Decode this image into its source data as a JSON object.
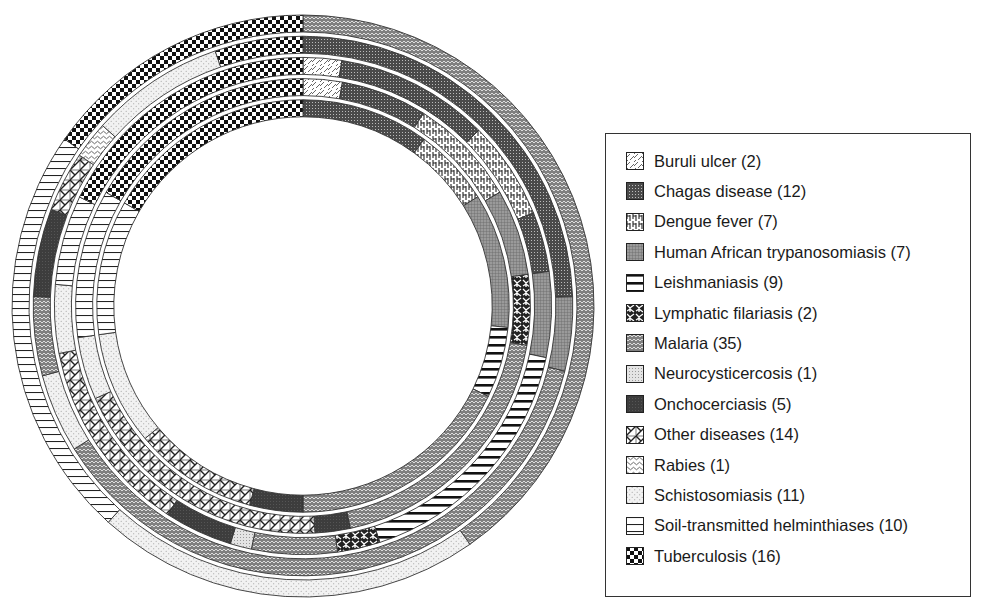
{
  "chart_data": {
    "type": "pie",
    "subtype": "concentric-rings",
    "title": "",
    "legend_position": "right",
    "categories": [
      {
        "key": "buruli",
        "label": "Buruli ulcer (2)",
        "count": 2
      },
      {
        "key": "chagas",
        "label": "Chagas disease (12)",
        "count": 12
      },
      {
        "key": "dengue",
        "label": "Dengue fever (7)",
        "count": 7
      },
      {
        "key": "hat",
        "label": "Human African trypanosomiasis (7)",
        "count": 7
      },
      {
        "key": "leish",
        "label": "Leishmaniasis (9)",
        "count": 9
      },
      {
        "key": "lymph",
        "label": "Lymphatic filariasis (2)",
        "count": 2
      },
      {
        "key": "malaria",
        "label": "Malaria (35)",
        "count": 35
      },
      {
        "key": "neuro",
        "label": "Neurocysticercosis (1)",
        "count": 1
      },
      {
        "key": "oncho",
        "label": "Onchocerciasis (5)",
        "count": 5
      },
      {
        "key": "other",
        "label": "Other diseases (14)",
        "count": 14
      },
      {
        "key": "rabies",
        "label": "Rabies (1)",
        "count": 1
      },
      {
        "key": "schisto",
        "label": "Schistosomiasis (11)",
        "count": 11
      },
      {
        "key": "soil",
        "label": "Soil-transmitted helminthiases (10)",
        "count": 10
      },
      {
        "key": "tb",
        "label": "Tuberculosis (16)",
        "count": 16
      }
    ],
    "rings_outer_to_inner_degrees_clockwise_from_top": [
      [
        {
          "cat": "malaria",
          "start": 0,
          "end": 145
        },
        {
          "cat": "schisto",
          "start": 145,
          "end": 222
        },
        {
          "cat": "soil",
          "start": 222,
          "end": 305
        },
        {
          "cat": "tb",
          "start": 305,
          "end": 360
        }
      ],
      [
        {
          "cat": "chagas",
          "start": 0,
          "end": 88
        },
        {
          "cat": "hat",
          "start": 88,
          "end": 104
        },
        {
          "cat": "malaria",
          "start": 104,
          "end": 238
        },
        {
          "cat": "schisto",
          "start": 238,
          "end": 255
        },
        {
          "cat": "malaria",
          "start": 255,
          "end": 272
        },
        {
          "cat": "oncho",
          "start": 272,
          "end": 291
        },
        {
          "cat": "other",
          "start": 291,
          "end": 304
        },
        {
          "cat": "rabies",
          "start": 304,
          "end": 312
        },
        {
          "cat": "schisto",
          "start": 312,
          "end": 341
        },
        {
          "cat": "tb",
          "start": 341,
          "end": 360
        }
      ],
      [
        {
          "cat": "buruli",
          "start": 0,
          "end": 9
        },
        {
          "cat": "chagas",
          "start": 9,
          "end": 45
        },
        {
          "cat": "dengue",
          "start": 45,
          "end": 68
        },
        {
          "cat": "chagas",
          "start": 68,
          "end": 82
        },
        {
          "cat": "hat",
          "start": 82,
          "end": 102
        },
        {
          "cat": "leish",
          "start": 102,
          "end": 162
        },
        {
          "cat": "lymph",
          "start": 162,
          "end": 172
        },
        {
          "cat": "malaria",
          "start": 172,
          "end": 192
        },
        {
          "cat": "neuro",
          "start": 192,
          "end": 197
        },
        {
          "cat": "oncho",
          "start": 197,
          "end": 213
        },
        {
          "cat": "other",
          "start": 213,
          "end": 259
        },
        {
          "cat": "schisto",
          "start": 259,
          "end": 275
        },
        {
          "cat": "soil",
          "start": 275,
          "end": 296
        },
        {
          "cat": "tb",
          "start": 296,
          "end": 360
        }
      ],
      [
        {
          "cat": "buruli",
          "start": 0,
          "end": 10
        },
        {
          "cat": "chagas",
          "start": 10,
          "end": 32
        },
        {
          "cat": "dengue",
          "start": 32,
          "end": 60
        },
        {
          "cat": "hat",
          "start": 60,
          "end": 82
        },
        {
          "cat": "lymph",
          "start": 82,
          "end": 100
        },
        {
          "cat": "malaria",
          "start": 100,
          "end": 168
        },
        {
          "cat": "oncho",
          "start": 168,
          "end": 177
        },
        {
          "cat": "other",
          "start": 177,
          "end": 246
        },
        {
          "cat": "schisto",
          "start": 246,
          "end": 262
        },
        {
          "cat": "soil",
          "start": 262,
          "end": 300
        },
        {
          "cat": "tb",
          "start": 300,
          "end": 360
        }
      ],
      [
        {
          "cat": "chagas",
          "start": 0,
          "end": 36
        },
        {
          "cat": "dengue",
          "start": 36,
          "end": 58
        },
        {
          "cat": "hat",
          "start": 58,
          "end": 96
        },
        {
          "cat": "leish",
          "start": 96,
          "end": 116
        },
        {
          "cat": "malaria",
          "start": 116,
          "end": 180
        },
        {
          "cat": "oncho",
          "start": 180,
          "end": 195
        },
        {
          "cat": "other",
          "start": 195,
          "end": 230
        },
        {
          "cat": "schisto",
          "start": 230,
          "end": 262
        },
        {
          "cat": "soil",
          "start": 262,
          "end": 300
        },
        {
          "cat": "tb",
          "start": 300,
          "end": 360
        }
      ]
    ]
  }
}
